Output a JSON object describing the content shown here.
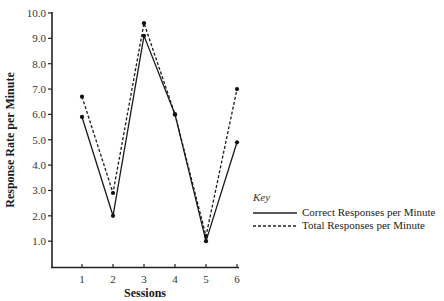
{
  "chart_data": {
    "type": "line",
    "title": "",
    "xlabel": "Sessions",
    "ylabel": "Response Rate per Minute",
    "x": [
      1,
      2,
      3,
      4,
      5,
      6
    ],
    "x_tick_labels": [
      "1",
      "2",
      "3",
      "4",
      "5",
      "6"
    ],
    "y_tick_labels": [
      "1.0",
      "2.0",
      "3.0",
      "4.0",
      "5.0",
      "6.0",
      "7.0",
      "8.0",
      "9.0",
      "10.0"
    ],
    "ylim": [
      0,
      10
    ],
    "grid": false,
    "legend_title": "Key",
    "legend_position": "right",
    "series": [
      {
        "name": "Correct Responses per Minute",
        "style": "solid",
        "values": [
          5.9,
          2.0,
          9.1,
          6.0,
          1.0,
          4.9
        ]
      },
      {
        "name": "Total Responses per Minute",
        "style": "dashed",
        "values": [
          6.7,
          2.9,
          9.6,
          6.0,
          1.2,
          7.0
        ]
      }
    ]
  }
}
